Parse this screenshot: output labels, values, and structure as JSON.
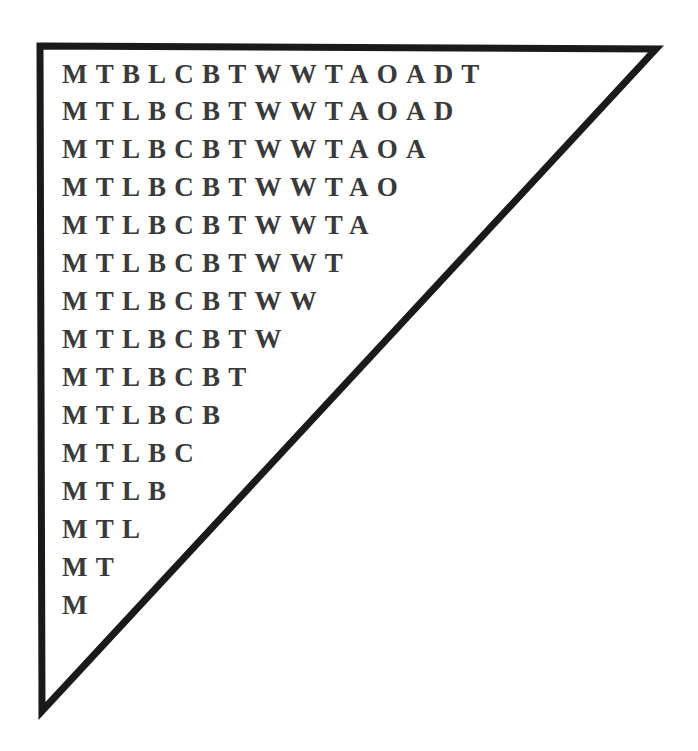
{
  "diagram": {
    "shape": "right-triangle",
    "stroke_color": "#1a1a1a",
    "text_color": "#3a3a3a",
    "rows": [
      "MTBLCBTWWTAOADT",
      "MTLBCBTWWTAOAD",
      "MTLBCBTWWTAOA",
      "MTLBCBTWWTAO",
      "MTLBCBTWWTA",
      "MTLBCBTWWT",
      "MTLBCBTWW",
      "MTLBCBTW",
      "MTLBCBT",
      "MTLBCB",
      "MTLBC",
      "MTLB",
      "MTL",
      "MT",
      "M"
    ]
  }
}
